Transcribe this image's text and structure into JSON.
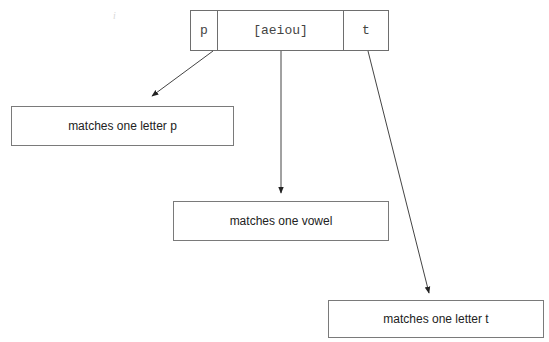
{
  "pattern": {
    "tokens": [
      {
        "text": "p"
      },
      {
        "text": "[aeiou]"
      },
      {
        "text": "t"
      }
    ]
  },
  "descriptions": [
    {
      "text": "matches one letter p"
    },
    {
      "text": "matches one vowel"
    },
    {
      "text": "matches one letter t"
    }
  ],
  "stray_mark": "i",
  "colors": {
    "border": "#6e6e6e",
    "arrow": "#333333",
    "text": "#222222"
  }
}
